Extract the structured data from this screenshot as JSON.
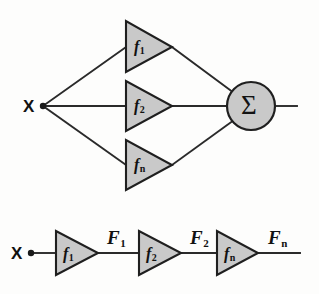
{
  "figure": {
    "background_color": "#fdfdfc",
    "line_color": "#2a2a2a",
    "block_fill_color": "#c9c9c9",
    "block_stroke_color": "#1f1f1f",
    "text_color": "#111111"
  },
  "parallel_stage": {
    "input_label": "X",
    "sum_symbol": "Σ",
    "branches": [
      {
        "base": "f",
        "sub": "1"
      },
      {
        "base": "f",
        "sub": "2"
      },
      {
        "base": "f",
        "sub": "n"
      }
    ]
  },
  "cascade_stage": {
    "input_label": "X",
    "blocks": [
      {
        "base": "f",
        "sub": "1"
      },
      {
        "base": "f",
        "sub": "2"
      },
      {
        "base": "f",
        "sub": "n"
      }
    ],
    "signals": [
      {
        "base": "F",
        "sub": "1"
      },
      {
        "base": "F",
        "sub": "2"
      },
      {
        "base": "F",
        "sub": "n"
      }
    ]
  }
}
